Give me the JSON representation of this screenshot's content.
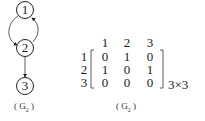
{
  "graph": {
    "nodes": [
      {
        "id": "1",
        "label": "1"
      },
      {
        "id": "2",
        "label": "2"
      },
      {
        "id": "3",
        "label": "3"
      }
    ],
    "edges": [
      {
        "from": "1",
        "to": "2",
        "style": "curved-left"
      },
      {
        "from": "2",
        "to": "1",
        "style": "curved-right"
      },
      {
        "from": "2",
        "to": "3",
        "style": "straight"
      }
    ],
    "caption_open": "(",
    "caption_main": "G",
    "caption_sub": "2",
    "caption_close": ")"
  },
  "matrix": {
    "column_headers": [
      "1",
      "2",
      "3"
    ],
    "row_headers": [
      "1",
      "2",
      "3"
    ],
    "rows": [
      [
        "0",
        "1",
        "0"
      ],
      [
        "1",
        "0",
        "1"
      ],
      [
        "0",
        "0",
        "0"
      ]
    ],
    "dimension_label": "3×3",
    "caption_open": "(",
    "caption_main": "G",
    "caption_sub": "2",
    "caption_close": ")"
  },
  "colors": {
    "ink": "#1a1a1a",
    "background": "#ffffff"
  }
}
